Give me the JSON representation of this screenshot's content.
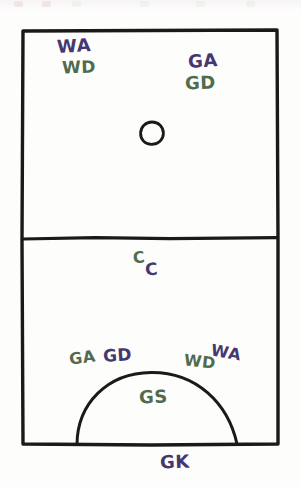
{
  "page": {
    "background_color": "#fdfdfc",
    "medium": "hand-drawn ink on paper"
  },
  "colors": {
    "ink_line": "#1a1a1a",
    "team_purple": "#45376f",
    "team_green": "#506b4e",
    "paper": "#fdfdfc"
  },
  "court": {
    "outline_name": "court-boundary",
    "center_line_name": "center-third-line",
    "center_circle_name": "center-circle",
    "goal_circle_name": "goal-circle-arc"
  },
  "labels": {
    "top_left": [
      {
        "text": "WA",
        "team": "purple"
      },
      {
        "text": "WD",
        "team": "green"
      }
    ],
    "top_right": [
      {
        "text": "GA",
        "team": "purple"
      },
      {
        "text": "GD",
        "team": "green"
      }
    ],
    "center": [
      {
        "text": "C",
        "team": "green"
      },
      {
        "text": "C",
        "team": "purple"
      }
    ],
    "goal_arc": [
      {
        "text": "GA",
        "team": "green"
      },
      {
        "text": "GD",
        "team": "purple"
      },
      {
        "text": "WD",
        "team": "green"
      },
      {
        "text": "WA",
        "team": "purple"
      }
    ],
    "goal_circle": [
      {
        "text": "GS",
        "team": "green"
      }
    ],
    "baseline": [
      {
        "text": "GK",
        "team": "purple"
      }
    ]
  }
}
